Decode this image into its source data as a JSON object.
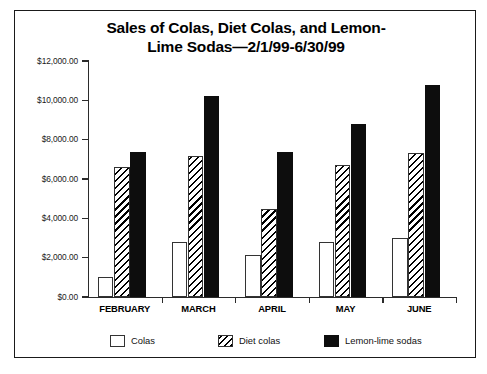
{
  "chart_data": {
    "type": "bar",
    "title_line1": "Sales of Colas, Diet Colas, and Lemon-",
    "title_line2": "Lime Sodas—2/1/99-6/30/99",
    "xlabel": "",
    "ylabel": "",
    "ylim": [
      0,
      12000
    ],
    "ytick_values": [
      0,
      2000,
      4000,
      6000,
      8000,
      10000,
      12000
    ],
    "ytick_labels": [
      "$0.00",
      "$2,000.00",
      "$4,000.00",
      "$6,000.00",
      "$8,000.00",
      "$10,000.00",
      "$12,000.00"
    ],
    "categories": [
      "FEBRUARY",
      "MARCH",
      "APRIL",
      "MAY",
      "JUNE"
    ],
    "grid": false,
    "legend_position": "bottom",
    "series": [
      {
        "name": "Colas",
        "fill": "white-outline",
        "color": "#ffffff",
        "values": [
          1000,
          2800,
          2150,
          2800,
          3000
        ]
      },
      {
        "name": "Diet colas",
        "fill": "diagonal-hatch",
        "color": "#000000",
        "values": [
          6600,
          7150,
          4500,
          6700,
          7300
        ]
      },
      {
        "name": "Lemon-lime sodas",
        "fill": "solid-black",
        "color": "#0d0d0d",
        "values": [
          7350,
          10200,
          7350,
          8800,
          10800
        ]
      }
    ]
  }
}
